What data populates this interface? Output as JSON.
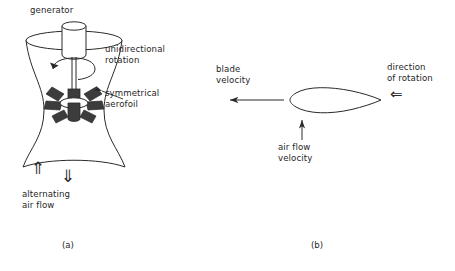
{
  "figure": {
    "background_color": "#ffffff",
    "line_color": "#2a2a2a",
    "blade_fill_color": "#3c3c3c",
    "text_color": "#1f1f1f"
  },
  "panel_a": {
    "caption": "(a)",
    "labels": {
      "generator": "generator",
      "unidirectional_rotation": "unidirectional\nrotation",
      "symmetrical_aerofoil": "symmetrical\naerofoil",
      "alternating_air_flow": "alternating\nair flow"
    },
    "icons": {
      "arrow_up": "⇑",
      "arrow_down": "⇓"
    },
    "parts": {
      "duct_shape": "venturi-hourglass",
      "blade_count": 6,
      "rotation_direction": "counter-clockwise"
    }
  },
  "panel_b": {
    "caption": "(b)",
    "labels": {
      "blade_velocity": "blade\nvelocity",
      "direction_of_rotation": "direction\nof rotation",
      "air_flow_velocity": "air flow\nvelocity"
    },
    "icons": {
      "arrow_rotation": "⇐"
    },
    "parts": {
      "aerofoil_shape": "symmetric-teardrop",
      "blade_velocity_direction": "left",
      "air_flow_velocity_direction": "up"
    }
  }
}
